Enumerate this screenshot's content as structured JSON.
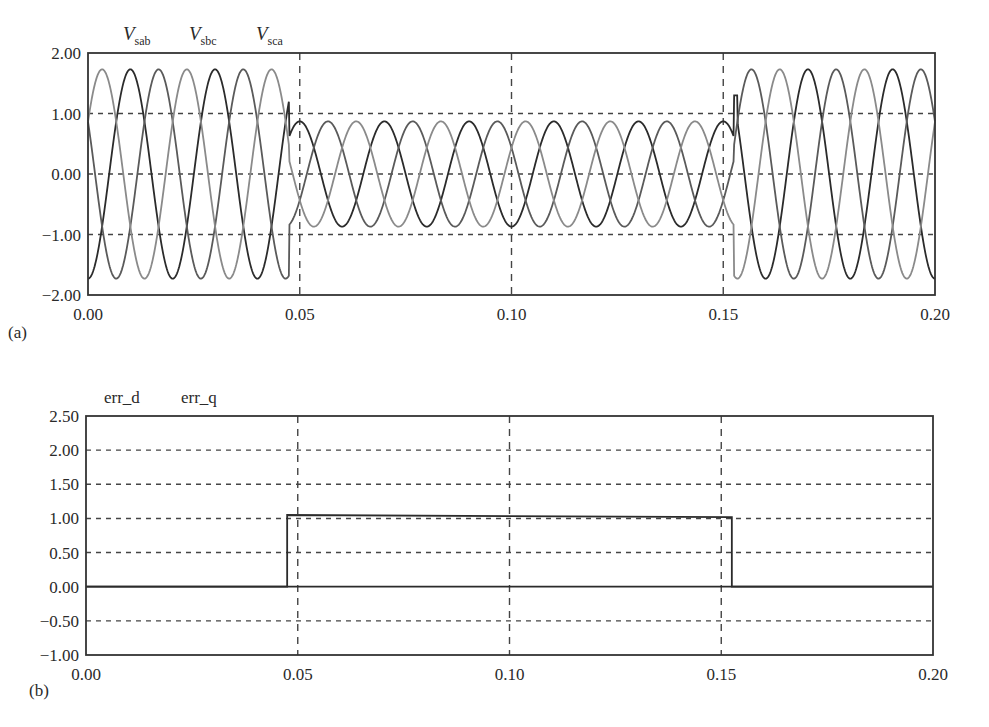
{
  "figure": {
    "panel_a_label": "(a)",
    "panel_b_label": "(b)"
  },
  "chart_data": [
    {
      "type": "line",
      "id": "a",
      "title": "",
      "xlabel": "",
      "ylabel": "",
      "legend": [
        {
          "main": "V",
          "sub": "sab",
          "color": "#2b2b2b"
        },
        {
          "main": "V",
          "sub": "sbc",
          "color": "#5a5a5a"
        },
        {
          "main": "V",
          "sub": "sca",
          "color": "#8a8a8a"
        }
      ],
      "legend_position": "top-left, above plot",
      "xlim": [
        0.0,
        0.2
      ],
      "ylim": [
        -2.0,
        2.0
      ],
      "xticks": [
        "0.00",
        "0.05",
        "0.10",
        "0.15",
        "0.20"
      ],
      "xtick_values": [
        0.0,
        0.05,
        0.1,
        0.15,
        0.2
      ],
      "yticks": [
        "2.00",
        "1.00",
        "0.00",
        "−1.00",
        "−2.00"
      ],
      "ytick_values": [
        2.0,
        1.0,
        0.0,
        -1.0,
        -2.0
      ],
      "grid": "dashed at y=±1, 0 and x=0.05, 0.10, 0.15",
      "frequency_hz": 50,
      "sag_start": 0.0475,
      "sag_end": 0.1525,
      "series": [
        {
          "name": "Vsab",
          "normal_amplitude": 1.73,
          "sag_amplitude": 0.87,
          "phase_deg": -90
        },
        {
          "name": "Vsbc",
          "normal_amplitude": 1.73,
          "sag_amplitude": 0.87,
          "phase_deg": -210
        },
        {
          "name": "Vsca",
          "normal_amplitude": 1.73,
          "sag_amplitude": 0.87,
          "phase_deg": 30
        }
      ],
      "annotations": "three-phase line voltages; 50% sag between ~0.0475 s and ~0.1525 s with transient spike at recovery (~1.3)"
    },
    {
      "type": "line",
      "id": "b",
      "title": "",
      "xlabel": "",
      "ylabel": "",
      "legend": [
        {
          "main": "err_d",
          "color": "#2b2b2b"
        },
        {
          "main": "err_q",
          "color": "#2b2b2b"
        }
      ],
      "legend_position": "top-left, above plot",
      "xlim": [
        0.0,
        0.2
      ],
      "ylim": [
        -1.0,
        2.5
      ],
      "xticks": [
        "0.00",
        "0.05",
        "0.10",
        "0.15",
        "0.20"
      ],
      "xtick_values": [
        0.0,
        0.05,
        0.1,
        0.15,
        0.2
      ],
      "yticks": [
        "2.50",
        "2.00",
        "1.50",
        "1.00",
        "0.50",
        "0.00",
        "−0.50",
        "−1.00"
      ],
      "ytick_values": [
        2.5,
        2.0,
        1.5,
        1.0,
        0.5,
        0.0,
        -0.5,
        -1.0
      ],
      "grid": "dashed at y=2.0,1.5,1.0,0.5,-0.5 and x=0.05, 0.10, 0.15",
      "series": [
        {
          "name": "err_d",
          "x": [
            0.0,
            0.0475,
            0.0475,
            0.1525,
            0.1525,
            0.2
          ],
          "y": [
            0.0,
            0.0,
            1.05,
            1.02,
            0.0,
            0.0
          ]
        },
        {
          "name": "err_q",
          "x": [
            0.0,
            0.2
          ],
          "y": [
            0.0,
            0.0
          ]
        }
      ]
    }
  ]
}
